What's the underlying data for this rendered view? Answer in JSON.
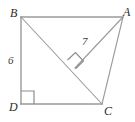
{
  "figure": {
    "kind": "geometry-diagram",
    "stroke_color": "#9a9a9a",
    "mark_color": "#8c8c8c",
    "label_color": "#2b2b2b",
    "background_color": "#ffffff",
    "vertices": [
      {
        "id": "B",
        "label": "B",
        "x": 21,
        "y": 17
      },
      {
        "id": "A",
        "label": "A",
        "x": 123,
        "y": 17
      },
      {
        "id": "D",
        "label": "D",
        "x": 21,
        "y": 104
      },
      {
        "id": "C",
        "label": "C",
        "x": 102,
        "y": 104
      }
    ],
    "segments": [
      {
        "id": "BA",
        "from": "B",
        "to": "A",
        "x1": 21,
        "y1": 17,
        "x2": 123,
        "y2": 17
      },
      {
        "id": "BD",
        "from": "B",
        "to": "D",
        "x1": 21,
        "y1": 17,
        "x2": 21,
        "y2": 104
      },
      {
        "id": "DC",
        "from": "D",
        "to": "C",
        "x1": 21,
        "y1": 104,
        "x2": 102,
        "y2": 104
      },
      {
        "id": "CA",
        "from": "C",
        "to": "A",
        "x1": 102,
        "y1": 104,
        "x2": 123,
        "y2": 17
      },
      {
        "id": "BC",
        "from": "B",
        "to": "C",
        "x1": 21,
        "y1": 17,
        "x2": 102,
        "y2": 104
      },
      {
        "id": "AF",
        "from": "A",
        "to": "foot",
        "x1": 123,
        "y1": 17,
        "x2": 75,
        "y2": 68
      }
    ],
    "foot_of_altitude": {
      "id": "F",
      "x": 75,
      "y": 68
    },
    "right_angles": [
      {
        "id": "right-angle-D",
        "at": "D",
        "style": "square",
        "size": 12
      },
      {
        "id": "right-angle-foot",
        "at": "F",
        "style": "square-rotated",
        "size": 11
      }
    ],
    "measure_labels": [
      {
        "id": "len-BD",
        "text": "6",
        "applies_to": "BD",
        "x": 8,
        "y": 55
      },
      {
        "id": "len-AF",
        "text": "7",
        "applies_to": "AF",
        "x": 82,
        "y": 36
      }
    ]
  },
  "labels": {
    "vertex_B": "B",
    "vertex_A": "A",
    "vertex_D": "D",
    "vertex_C": "C",
    "length_BD": "6",
    "length_AF": "7"
  }
}
